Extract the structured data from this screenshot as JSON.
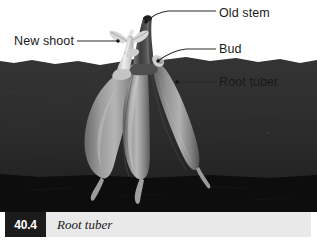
{
  "figure": {
    "caption": {
      "number": "40.4",
      "text": "Root tuber"
    },
    "labels": [
      {
        "id": "old-stem",
        "text": "Old stem"
      },
      {
        "id": "new-shoot",
        "text": "New shoot"
      },
      {
        "id": "bud",
        "text": "Bud"
      },
      {
        "id": "root-tuber",
        "text": "Root tuber"
      }
    ],
    "colors": {
      "page_background": "#ffffff",
      "soil_upper": "#2e2e2e",
      "soil_lower": "#0d0d0d",
      "tuber": "#8d8d8d",
      "tuber_highlight": "#c9c9c9",
      "tuber_shadow": "#5d5d5d",
      "old_stem": "#4a4a4a",
      "new_shoot": "#d8d8d8",
      "bud": "#d2d2d2",
      "leader_line": "#2b2b2b",
      "caption_bar": "#e9e9e9",
      "caption_number_box": "#1b1b1b",
      "caption_number_text": "#ffffff",
      "label_text": "#1a1a1a"
    },
    "parts": [
      {
        "name": "old-stem",
        "description": "dark curved stem emerging above soil"
      },
      {
        "name": "new-shoot",
        "description": "pale young shoot with small leaves"
      },
      {
        "name": "bud",
        "description": "small pale bump on stem base at soil line"
      },
      {
        "name": "root-tuber",
        "description": "three swollen spindle-shaped storage roots below soil"
      }
    ]
  }
}
